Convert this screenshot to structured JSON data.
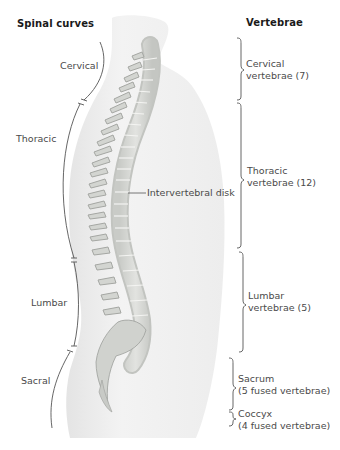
{
  "headings": {
    "left": "Spinal curves",
    "right": "Vertebrae"
  },
  "spinal_curves": [
    {
      "id": "cervical",
      "label": "Cervical"
    },
    {
      "id": "thoracic",
      "label": "Thoracic"
    },
    {
      "id": "lumbar",
      "label": "Lumbar"
    },
    {
      "id": "sacral",
      "label": "Sacral"
    }
  ],
  "vertebrae": [
    {
      "id": "cervical",
      "line1": "Cervical",
      "line2": "vertebrae (7)"
    },
    {
      "id": "thoracic",
      "line1": "Thoracic",
      "line2": "vertebrae (12)"
    },
    {
      "id": "lumbar",
      "line1": "Lumbar",
      "line2": "vertebrae (5)"
    },
    {
      "id": "sacrum",
      "line1": "Sacrum",
      "line2": "(5 fused vertebrae)"
    },
    {
      "id": "coccyx",
      "line1": "Coccyx",
      "line2": "(4 fused vertebrae)"
    }
  ],
  "callouts": {
    "disk": "Intervertebral disk"
  },
  "colors": {
    "body_fill": "#f0f0f0",
    "bone_fill": "#d6d8d4",
    "bone_stroke": "#9a9c98",
    "line": "#555555",
    "text": "#4a4a4a",
    "heading": "#1a1a1a"
  }
}
